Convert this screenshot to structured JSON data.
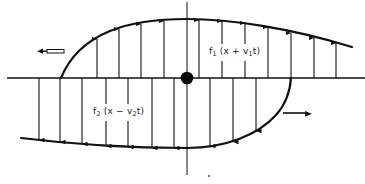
{
  "figure": {
    "wave_1": {
      "func": "f",
      "func_sub": "1",
      "arg_open": " (x + v",
      "arg_sub": "1",
      "arg_close": "t)",
      "direction": "left",
      "arrow_direction": "up"
    },
    "wave_2": {
      "func": "f",
      "func_sub": "2",
      "arg_open": " (x − v",
      "arg_sub": "2",
      "arg_close": "t)",
      "direction": "right",
      "arrow_direction": "down"
    },
    "colors": {
      "ink": "#111111",
      "background": "#ffffff"
    }
  }
}
